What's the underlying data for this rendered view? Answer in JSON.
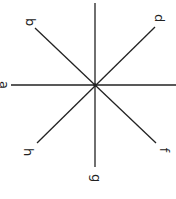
{
  "diagram": {
    "type": "star-of-lines",
    "center": [
      95,
      85
    ],
    "line_color": "#222222",
    "labels": {
      "a": "a",
      "b": "b",
      "d": "d",
      "f": "f",
      "g": "g",
      "h": "h"
    }
  }
}
